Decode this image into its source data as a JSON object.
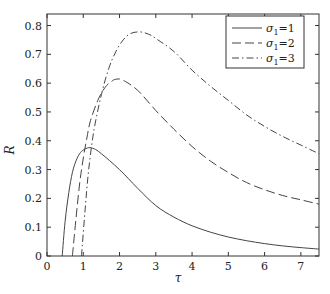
{
  "chart_data": {
    "type": "line",
    "title": "",
    "xlabel": "τ",
    "ylabel": "R",
    "xlim": [
      0,
      7.5
    ],
    "ylim": [
      0,
      0.84
    ],
    "xticks": [
      0,
      1,
      2,
      3,
      4,
      5,
      6,
      7
    ],
    "yticks": [
      0,
      0.1,
      0.2,
      0.3,
      0.4,
      0.5,
      0.6,
      0.7,
      0.8
    ],
    "ytick_labels": [
      "0",
      "0.1",
      "0.2",
      "0.3",
      "0.4",
      "0.5",
      "0.6",
      "0.7",
      "0.8"
    ],
    "grid": false,
    "legend_position": "upper right",
    "series": [
      {
        "name": "σ₁=1",
        "legend_sigma": "σ",
        "legend_sub": "1",
        "legend_value": "=1",
        "style": "solid",
        "x": [
          0.42,
          0.5,
          0.6,
          0.7,
          0.8,
          0.9,
          1.0,
          1.15,
          1.3,
          1.5,
          2.0,
          2.5,
          3.0,
          3.5,
          4.0,
          4.5,
          5.0,
          5.5,
          6.0,
          6.5,
          7.0,
          7.5
        ],
        "values": [
          0.0,
          0.12,
          0.22,
          0.29,
          0.33,
          0.355,
          0.368,
          0.376,
          0.372,
          0.355,
          0.3,
          0.235,
          0.175,
          0.135,
          0.105,
          0.083,
          0.066,
          0.053,
          0.043,
          0.035,
          0.029,
          0.024
        ]
      },
      {
        "name": "σ₁=2",
        "legend_sigma": "σ",
        "legend_sub": "1",
        "legend_value": "=2",
        "style": "dashed",
        "x": [
          0.7,
          0.8,
          0.9,
          1.0,
          1.1,
          1.2,
          1.4,
          1.6,
          1.8,
          1.93,
          2.1,
          2.5,
          3.0,
          3.5,
          4.0,
          4.5,
          5.0,
          5.5,
          6.0,
          6.5,
          7.0,
          7.5
        ],
        "values": [
          0.0,
          0.13,
          0.25,
          0.34,
          0.41,
          0.47,
          0.54,
          0.585,
          0.608,
          0.614,
          0.61,
          0.575,
          0.505,
          0.44,
          0.38,
          0.33,
          0.29,
          0.255,
          0.23,
          0.21,
          0.195,
          0.18
        ]
      },
      {
        "name": "σ₁=3",
        "legend_sigma": "σ",
        "legend_sub": "1",
        "legend_value": "=3",
        "style": "dashdot",
        "x": [
          0.95,
          1.05,
          1.15,
          1.3,
          1.5,
          1.7,
          1.9,
          2.1,
          2.3,
          2.56,
          2.8,
          3.0,
          3.5,
          4.0,
          4.5,
          5.0,
          5.5,
          6.0,
          6.5,
          7.0,
          7.5
        ],
        "values": [
          0.0,
          0.16,
          0.3,
          0.44,
          0.56,
          0.65,
          0.71,
          0.75,
          0.772,
          0.778,
          0.77,
          0.755,
          0.71,
          0.645,
          0.59,
          0.54,
          0.49,
          0.45,
          0.415,
          0.385,
          0.355
        ]
      }
    ]
  },
  "axes": {
    "xlabel": "τ",
    "ylabel": "R"
  },
  "legend": {
    "items": [
      {
        "sigma": "σ",
        "sub": "1",
        "value": "=1"
      },
      {
        "sigma": "σ",
        "sub": "1",
        "value": "=2"
      },
      {
        "sigma": "σ",
        "sub": "1",
        "value": "=3"
      }
    ]
  }
}
